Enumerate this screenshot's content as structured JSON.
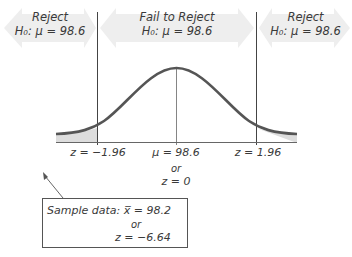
{
  "diagram": {
    "regions": [
      {
        "title": "Reject",
        "hypothesis": "H₀: μ = 98.6"
      },
      {
        "title": "Fail to Reject",
        "hypothesis": "H₀: μ = 98.6"
      },
      {
        "title": "Reject",
        "hypothesis": "H₀: μ = 98.6"
      }
    ],
    "axis_labels": {
      "left_critical": "z = −1.96",
      "center": "μ = 98.6",
      "right_critical": "z = 1.96",
      "center_or": "or",
      "center_z": "z = 0"
    },
    "sample_box": {
      "line1": "Sample data: x̅ = 98.2",
      "line2": "or",
      "line3": "z = −6.64"
    },
    "colors": {
      "curve": "#555555",
      "arrow_fill": "#ececec",
      "tail_fill": "#dcdcdc",
      "lines": "#444444"
    }
  }
}
